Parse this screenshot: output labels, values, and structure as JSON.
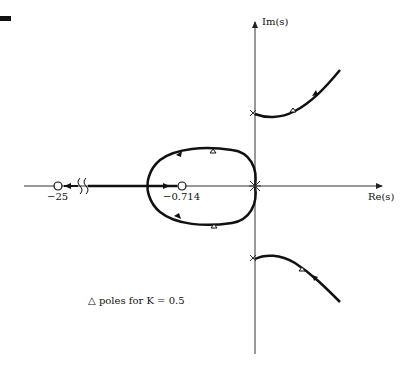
{
  "diagram": {
    "type": "root-locus",
    "axes": {
      "x_label": "Re(s)",
      "y_label": "Im(s)"
    },
    "zeros": [
      {
        "label": "−25",
        "value": -25
      },
      {
        "label": "−0.714",
        "value": -0.714
      }
    ],
    "poles": [
      {
        "location": "origin (double)"
      },
      {
        "location": "upper imaginary axis"
      },
      {
        "location": "lower imaginary axis"
      }
    ],
    "legend": {
      "symbol": "△",
      "text": "poles for K = 0.5"
    },
    "colors": {
      "axis": "#333333",
      "locus": "#111111",
      "background": "#ffffff"
    }
  }
}
